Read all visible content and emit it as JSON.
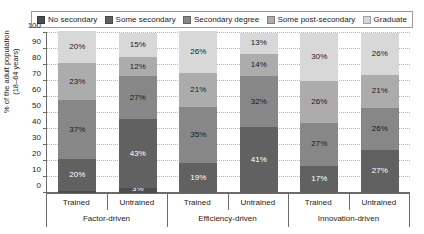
{
  "chart_data": {
    "type": "bar",
    "subtype": "stacked-bar-100",
    "title": "",
    "xlabel": "",
    "ylabel": "% of the adult population (18–64 years)",
    "ylim": [
      0,
      100
    ],
    "yticks": [
      0,
      10,
      20,
      30,
      40,
      50,
      60,
      70,
      80,
      90,
      100
    ],
    "grid": true,
    "legend_position": "top",
    "groups": [
      "Factor-driven",
      "Efficiency-driven",
      "Innovation-driven"
    ],
    "categories": [
      "Trained",
      "Untrained",
      "Trained",
      "Untrained",
      "Trained",
      "Untrained"
    ],
    "series": [
      {
        "name": "No secondary",
        "color": "#4d4d4d",
        "label_color": "#ffffff",
        "values": [
          1,
          3,
          0,
          0,
          0,
          0
        ]
      },
      {
        "name": "Some secondary",
        "color": "#616161",
        "label_color": "#ffffff",
        "values": [
          20,
          43,
          19,
          41,
          17,
          27
        ]
      },
      {
        "name": "Secondary degree",
        "color": "#878787",
        "label_color": "#1a1a1a",
        "values": [
          37,
          27,
          35,
          32,
          27,
          26
        ]
      },
      {
        "name": "Some post-secondary",
        "color": "#acacac",
        "label_color": "#1a1a1a",
        "values": [
          23,
          12,
          21,
          14,
          26,
          21
        ]
      },
      {
        "name": "Graduate",
        "color": "#d8d8d8",
        "label_color": "#1a1a1a",
        "values": [
          20,
          15,
          26,
          13,
          30,
          26
        ]
      }
    ],
    "bar_labels": [
      [
        "1%",
        "20%",
        "37%",
        "23%",
        "20%"
      ],
      [
        "3%",
        "43%",
        "27%",
        "12%",
        "15%"
      ],
      [
        "0%",
        "19%",
        "35%",
        "21%",
        "26%"
      ],
      [
        "0%",
        "41%",
        "32%",
        "14%",
        "13%"
      ],
      [
        "0%",
        "17%",
        "27%",
        "26%",
        "30%"
      ],
      [
        "0%",
        "27%",
        "26%",
        "21%",
        "26%"
      ]
    ]
  },
  "legend": {
    "items": [
      {
        "label": "No secondary",
        "color": "#4d4d4d"
      },
      {
        "label": "Some secondary",
        "color": "#616161"
      },
      {
        "label": "Secondary degree",
        "color": "#878787"
      },
      {
        "label": "Some post-secondary",
        "color": "#acacac"
      },
      {
        "label": "Graduate",
        "color": "#d8d8d8"
      }
    ]
  },
  "axis": {
    "y_title_line1": "% of the adult population",
    "y_title_line2": "(18–64 years)"
  }
}
